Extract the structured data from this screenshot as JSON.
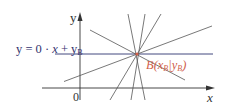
{
  "diagram": {
    "axes": {
      "x_label": "x",
      "y_label": "y",
      "origin_label": "0"
    },
    "horizontal_line": {
      "equation_parts": {
        "lhs": "y = 0 · ",
        "x": "x",
        "plus": " + y",
        "sub": "B"
      },
      "color": "#2e3470"
    },
    "point": {
      "name": "B",
      "label_parts": {
        "open": "B(x",
        "sub_x": "B",
        "mid": "|y",
        "sub_y": "B",
        "close": ")"
      },
      "color": "#d0604a"
    },
    "colors": {
      "axis": "#333333",
      "pencil_lines": "#555555",
      "horizontal_line": "#2e3470",
      "point_label": "#d0604a"
    }
  }
}
